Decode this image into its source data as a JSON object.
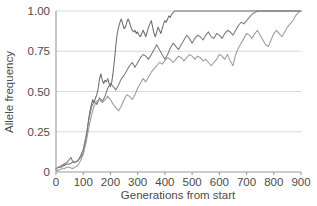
{
  "chart_data": {
    "type": "line",
    "title": "",
    "xlabel": "Generations from start",
    "ylabel": "Allele frequency",
    "xlim": [
      0,
      900
    ],
    "ylim": [
      0,
      1.0
    ],
    "grid": true,
    "grid_axis": "y",
    "legend": "none",
    "xticks": [
      0,
      100,
      200,
      300,
      400,
      500,
      600,
      700,
      800,
      900
    ],
    "xticklabels": [
      "0",
      "100",
      "200",
      "300",
      "400",
      "500",
      "600",
      "700",
      "800",
      "900"
    ],
    "yticks": [
      0,
      0.25,
      0.5,
      0.75,
      1.0
    ],
    "yticklabels": [
      "0",
      "0.25",
      "0.50",
      "0.75",
      "1.00"
    ],
    "colors": {
      "replicate_1": "#6d6d6d",
      "replicate_2": "#7a7a7a",
      "replicate_3": "#9b9b9b",
      "gridline": "#d5d5d5",
      "axis": "#9a9a9a",
      "text": "#4b4b4b"
    },
    "series": [
      {
        "name": "replicate_1",
        "color": "#6d6d6d",
        "x": [
          0,
          10,
          20,
          30,
          40,
          50,
          60,
          70,
          80,
          90,
          100,
          110,
          115,
          120,
          125,
          130,
          135,
          140,
          145,
          150,
          155,
          160,
          165,
          170,
          175,
          180,
          185,
          190,
          195,
          200,
          205,
          210,
          215,
          220,
          225,
          230,
          235,
          240,
          245,
          250,
          255,
          260,
          265,
          270,
          275,
          280,
          285,
          290,
          295,
          300,
          305,
          310,
          315,
          320,
          325,
          330,
          335,
          340,
          345,
          350,
          355,
          360,
          365,
          370,
          375,
          380,
          385,
          390,
          395,
          400,
          405,
          410,
          415,
          420,
          425,
          430,
          435,
          440,
          900
        ],
        "y": [
          0.02,
          0.03,
          0.03,
          0.04,
          0.05,
          0.05,
          0.06,
          0.06,
          0.07,
          0.09,
          0.12,
          0.2,
          0.26,
          0.33,
          0.38,
          0.42,
          0.45,
          0.43,
          0.46,
          0.48,
          0.52,
          0.58,
          0.61,
          0.57,
          0.55,
          0.57,
          0.56,
          0.58,
          0.55,
          0.53,
          0.56,
          0.62,
          0.7,
          0.79,
          0.86,
          0.9,
          0.93,
          0.95,
          0.92,
          0.89,
          0.9,
          0.93,
          0.95,
          0.93,
          0.9,
          0.88,
          0.87,
          0.88,
          0.86,
          0.87,
          0.85,
          0.84,
          0.86,
          0.88,
          0.86,
          0.84,
          0.87,
          0.9,
          0.92,
          0.94,
          0.9,
          0.86,
          0.84,
          0.87,
          0.9,
          0.88,
          0.86,
          0.89,
          0.92,
          0.94,
          0.93,
          0.95,
          0.97,
          0.96,
          0.98,
          0.99,
          1.0,
          1.0,
          1.0
        ]
      },
      {
        "name": "replicate_2",
        "color": "#7a7a7a",
        "x": [
          0,
          10,
          20,
          30,
          40,
          50,
          55,
          60,
          70,
          80,
          90,
          100,
          110,
          120,
          130,
          140,
          150,
          160,
          170,
          180,
          190,
          200,
          210,
          220,
          230,
          240,
          250,
          260,
          270,
          280,
          290,
          300,
          310,
          320,
          330,
          340,
          350,
          360,
          370,
          380,
          390,
          400,
          410,
          420,
          430,
          440,
          450,
          460,
          470,
          480,
          490,
          500,
          510,
          520,
          530,
          540,
          550,
          560,
          570,
          580,
          590,
          600,
          610,
          620,
          630,
          640,
          650,
          660,
          670,
          680,
          690,
          700,
          710,
          720,
          730,
          740,
          750,
          900
        ],
        "y": [
          0.02,
          0.03,
          0.04,
          0.05,
          0.06,
          0.08,
          0.09,
          0.07,
          0.06,
          0.07,
          0.1,
          0.14,
          0.22,
          0.32,
          0.4,
          0.44,
          0.42,
          0.46,
          0.44,
          0.47,
          0.52,
          0.55,
          0.53,
          0.51,
          0.54,
          0.58,
          0.6,
          0.63,
          0.66,
          0.68,
          0.65,
          0.68,
          0.71,
          0.73,
          0.72,
          0.7,
          0.73,
          0.76,
          0.79,
          0.76,
          0.73,
          0.7,
          0.73,
          0.77,
          0.8,
          0.78,
          0.76,
          0.79,
          0.82,
          0.85,
          0.83,
          0.8,
          0.83,
          0.85,
          0.84,
          0.82,
          0.85,
          0.87,
          0.84,
          0.83,
          0.86,
          0.85,
          0.83,
          0.86,
          0.88,
          0.87,
          0.85,
          0.88,
          0.91,
          0.93,
          0.92,
          0.94,
          0.96,
          0.98,
          0.99,
          1.0,
          1.0,
          1.0
        ]
      },
      {
        "name": "replicate_3",
        "color": "#9b9b9b",
        "x": [
          0,
          10,
          20,
          30,
          40,
          50,
          60,
          70,
          80,
          90,
          100,
          110,
          120,
          130,
          140,
          150,
          160,
          170,
          180,
          190,
          200,
          210,
          220,
          230,
          240,
          250,
          260,
          270,
          280,
          290,
          300,
          310,
          320,
          330,
          340,
          350,
          360,
          370,
          380,
          390,
          400,
          410,
          420,
          430,
          440,
          450,
          460,
          470,
          480,
          490,
          500,
          510,
          520,
          530,
          540,
          550,
          560,
          570,
          580,
          590,
          600,
          610,
          620,
          630,
          640,
          650,
          660,
          670,
          680,
          690,
          700,
          710,
          720,
          730,
          740,
          750,
          760,
          770,
          780,
          790,
          800,
          810,
          820,
          830,
          840,
          850,
          860,
          870,
          880,
          890,
          900
        ],
        "y": [
          0.01,
          0.01,
          0.02,
          0.02,
          0.03,
          0.03,
          0.02,
          0.03,
          0.04,
          0.07,
          0.11,
          0.18,
          0.27,
          0.35,
          0.41,
          0.44,
          0.45,
          0.43,
          0.45,
          0.47,
          0.45,
          0.42,
          0.4,
          0.38,
          0.41,
          0.45,
          0.48,
          0.47,
          0.45,
          0.48,
          0.52,
          0.55,
          0.58,
          0.56,
          0.59,
          0.62,
          0.64,
          0.66,
          0.68,
          0.67,
          0.69,
          0.71,
          0.7,
          0.68,
          0.7,
          0.72,
          0.71,
          0.69,
          0.71,
          0.73,
          0.72,
          0.7,
          0.72,
          0.71,
          0.69,
          0.7,
          0.68,
          0.66,
          0.68,
          0.7,
          0.73,
          0.72,
          0.7,
          0.73,
          0.69,
          0.66,
          0.73,
          0.77,
          0.8,
          0.83,
          0.86,
          0.85,
          0.83,
          0.86,
          0.88,
          0.85,
          0.82,
          0.79,
          0.78,
          0.82,
          0.86,
          0.88,
          0.86,
          0.84,
          0.87,
          0.9,
          0.92,
          0.94,
          0.97,
          0.99,
          1.0
        ]
      }
    ]
  }
}
